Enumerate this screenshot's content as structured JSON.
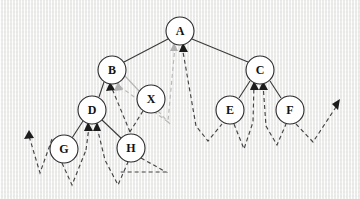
{
  "diagram": {
    "kind": "tree-with-traversal-path",
    "background_color": "#f2f2f1",
    "node_fill": "#ffffff",
    "node_stroke": "#2b2b2b",
    "edge_color": "#3a3a3a",
    "traversal_color": "#454545",
    "traversal_highlight_color": "#b9b9b9",
    "nodes": [
      {
        "id": "A",
        "label": "A",
        "cx": 180,
        "cy": 31,
        "r": 14
      },
      {
        "id": "B",
        "label": "B",
        "cx": 112,
        "cy": 70,
        "r": 14
      },
      {
        "id": "C",
        "label": "C",
        "cx": 260,
        "cy": 70,
        "r": 14
      },
      {
        "id": "X",
        "label": "X",
        "cx": 151,
        "cy": 99,
        "r": 14
      },
      {
        "id": "D",
        "label": "D",
        "cx": 92,
        "cy": 110,
        "r": 14
      },
      {
        "id": "E",
        "label": "E",
        "cx": 230,
        "cy": 110,
        "r": 14
      },
      {
        "id": "F",
        "label": "F",
        "cx": 290,
        "cy": 110,
        "r": 14
      },
      {
        "id": "G",
        "label": "G",
        "cx": 64,
        "cy": 149,
        "r": 14
      },
      {
        "id": "H",
        "label": "H",
        "cx": 131,
        "cy": 148,
        "r": 14
      }
    ],
    "edges": [
      {
        "from": "A",
        "to": "B",
        "style": "solid"
      },
      {
        "from": "A",
        "to": "C",
        "style": "solid"
      },
      {
        "from": "B",
        "to": "D",
        "style": "solid"
      },
      {
        "from": "B",
        "to": "X",
        "style": "solid-light"
      },
      {
        "from": "C",
        "to": "E",
        "style": "solid"
      },
      {
        "from": "C",
        "to": "F",
        "style": "solid"
      },
      {
        "from": "D",
        "to": "G",
        "style": "solid"
      },
      {
        "from": "D",
        "to": "H",
        "style": "solid"
      }
    ],
    "traversal_arrowheads": [
      {
        "at": "A",
        "count": 2,
        "tones": [
          "light",
          "dark"
        ]
      },
      {
        "at": "B",
        "count": 2,
        "tones": [
          "dark",
          "light"
        ]
      },
      {
        "at": "C",
        "count": 2,
        "tones": [
          "dark",
          "dark"
        ]
      },
      {
        "at": "D",
        "count": 2,
        "tones": [
          "dark",
          "dark"
        ]
      },
      {
        "at": "left-margin",
        "count": 1,
        "tones": [
          "dark"
        ]
      },
      {
        "at": "right-margin",
        "count": 1,
        "tones": [
          "dark"
        ]
      }
    ]
  }
}
